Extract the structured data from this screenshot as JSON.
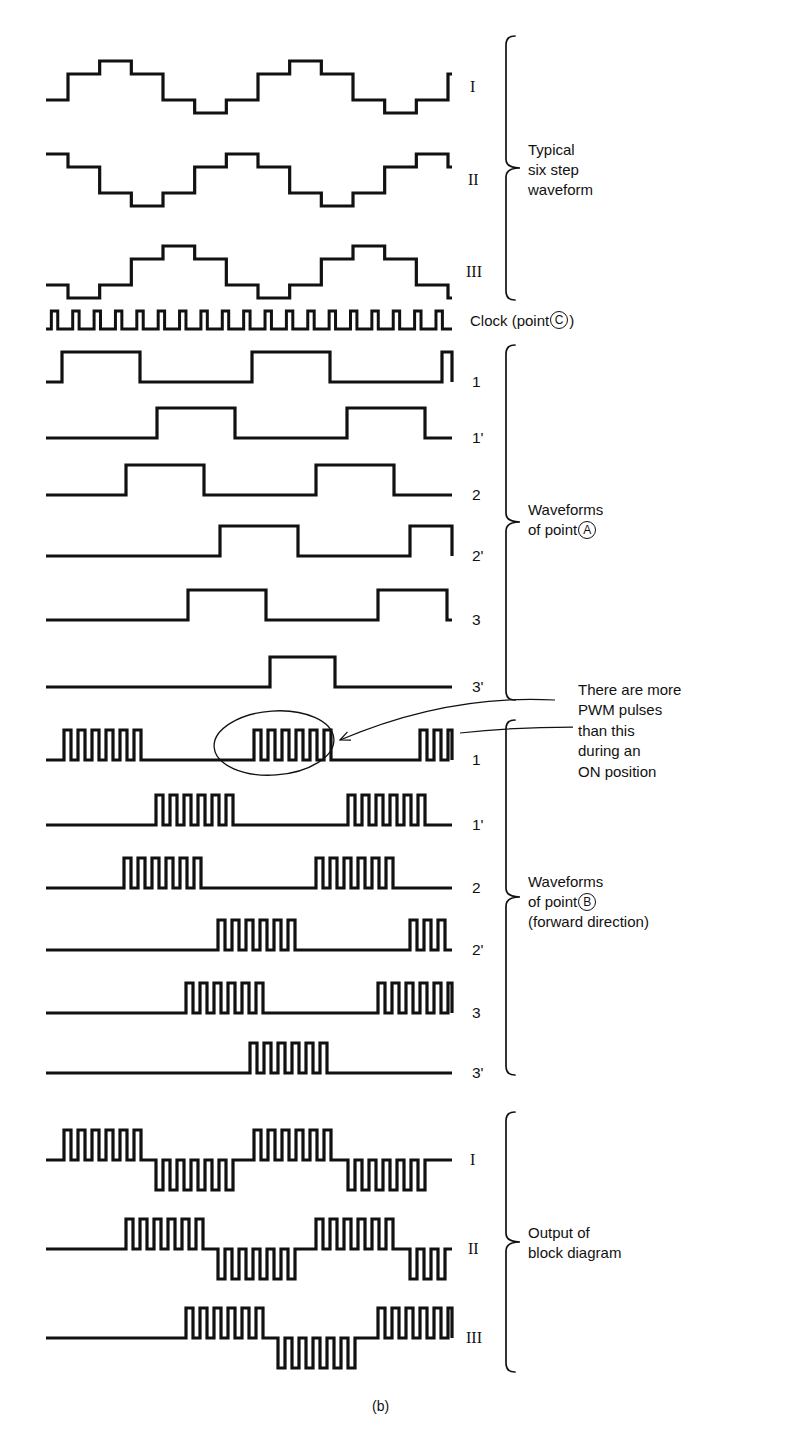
{
  "figure": {
    "caption": "(b)",
    "background": "#ffffff",
    "ink": "#111111"
  },
  "groups": [
    {
      "id": "six-step",
      "label_lines": "Typical\nsix step\nwaveform",
      "brace": {
        "x": 506,
        "top": 36,
        "bottom": 300,
        "tipx": 520,
        "midy": 168
      },
      "label_pos": {
        "x": 528,
        "y": 140
      }
    },
    {
      "id": "point-a",
      "label_line1": "Waveforms",
      "label_line2_pre": "of point",
      "label_circle": "A",
      "brace": {
        "x": 506,
        "top": 345,
        "bottom": 700,
        "tipx": 520,
        "midy": 522
      },
      "label_pos": {
        "x": 528,
        "y": 500
      }
    },
    {
      "id": "point-b",
      "label_line1": "Waveforms",
      "label_line2_pre": "of point",
      "label_circle": "B",
      "label_line3": "(forward direction)",
      "brace": {
        "x": 506,
        "top": 720,
        "bottom": 1075,
        "tipx": 520,
        "midy": 897
      },
      "label_pos": {
        "x": 528,
        "y": 872
      }
    },
    {
      "id": "output",
      "label_lines": "Output of\nblock diagram",
      "brace": {
        "x": 506,
        "top": 1112,
        "bottom": 1372,
        "tipx": 520,
        "midy": 1242
      },
      "label_pos": {
        "x": 528,
        "y": 1223
      }
    }
  ],
  "clock": {
    "label_prefix": "Clock (point",
    "label_circle": "C",
    "label_suffix": ")",
    "label_pos": {
      "x": 470,
      "y": 311
    },
    "pulses": 19,
    "baseline_y": 329,
    "amplitude": 18,
    "x_start": 46,
    "x_end": 452,
    "duty": 0.5
  },
  "annotation": {
    "text": "There are more\nPWM pulses\nthan this\nduring an\nON position",
    "pos": {
      "x": 578,
      "y": 680
    },
    "ellipse": {
      "cx": 274,
      "cy": 743,
      "rx": 60,
      "ry": 32,
      "rotate": -4
    },
    "arrow": {
      "from_x": 555,
      "from_y": 700,
      "to_x": 340,
      "to_y": 740
    },
    "leader": {
      "x1": 460,
      "y1": 727,
      "x2": 573,
      "y2": 727
    }
  },
  "rows": [
    {
      "name": "six-step-I",
      "label": "I",
      "label_style": "roman",
      "label_x": 470,
      "baseline_y": 87,
      "type": "sixstep",
      "phase": 0,
      "step_h": 26,
      "x_start": 46,
      "x_end": 452,
      "period": 190,
      "start_offset": 22
    },
    {
      "name": "six-step-II",
      "label": "II",
      "label_style": "roman",
      "label_x": 468,
      "baseline_y": 180,
      "type": "sixstep",
      "phase": 2,
      "step_h": 26,
      "x_start": 46,
      "x_end": 452,
      "period": 190,
      "start_offset": 22
    },
    {
      "name": "six-step-III",
      "label": "III",
      "label_style": "roman",
      "label_x": 466,
      "baseline_y": 272,
      "type": "sixstep",
      "phase": 4,
      "step_h": 26,
      "x_start": 46,
      "x_end": 452,
      "period": 190,
      "start_offset": 22
    },
    {
      "name": "point-a-1",
      "label": "1",
      "label_style": "num",
      "label_x": 472,
      "baseline_y": 382,
      "type": "square",
      "pulse_h": 30,
      "x_start": 46,
      "x_end": 452,
      "pulses": [
        [
          62,
          140
        ],
        [
          252,
          330
        ],
        [
          442,
          452
        ]
      ]
    },
    {
      "name": "point-a-1p",
      "label": "1'",
      "label_style": "num",
      "label_x": 472,
      "baseline_y": 438,
      "type": "square",
      "pulse_h": 30,
      "x_start": 46,
      "x_end": 452,
      "pulses": [
        [
          157,
          235
        ],
        [
          347,
          425
        ]
      ]
    },
    {
      "name": "point-a-2",
      "label": "2",
      "label_style": "num",
      "label_x": 472,
      "baseline_y": 495,
      "type": "square",
      "pulse_h": 30,
      "x_start": 46,
      "x_end": 452,
      "pulses": [
        [
          126,
          204
        ],
        [
          316,
          394
        ]
      ]
    },
    {
      "name": "point-a-2p",
      "label": "2'",
      "label_style": "num",
      "label_x": 472,
      "baseline_y": 556,
      "type": "square",
      "pulse_h": 30,
      "x_start": 46,
      "x_end": 452,
      "pulses": [
        [
          220,
          298
        ],
        [
          410,
          452
        ]
      ]
    },
    {
      "name": "point-a-3",
      "label": "3",
      "label_style": "num",
      "label_x": 472,
      "baseline_y": 620,
      "type": "square",
      "pulse_h": 30,
      "x_start": 46,
      "x_end": 452,
      "pulses": [
        [
          188,
          266
        ],
        [
          378,
          447
        ]
      ]
    },
    {
      "name": "point-a-3p",
      "label": "3'",
      "label_style": "num",
      "label_x": 472,
      "baseline_y": 687,
      "type": "square",
      "pulse_h": 30,
      "x_start": 46,
      "x_end": 452,
      "pulses": [
        [
          270,
          335
        ]
      ]
    },
    {
      "name": "point-b-1",
      "label": "1",
      "label_style": "num",
      "label_x": 472,
      "baseline_y": 760,
      "type": "burst",
      "pulse_h": 30,
      "x_start": 46,
      "x_end": 452,
      "pulse_w": 7,
      "gap_w": 7,
      "bursts": [
        {
          "x": 64,
          "count": 6
        },
        {
          "x": 254,
          "count": 6
        },
        {
          "x": 420,
          "count": 3
        }
      ]
    },
    {
      "name": "point-b-1p",
      "label": "1'",
      "label_style": "num",
      "label_x": 472,
      "baseline_y": 825,
      "type": "burst",
      "pulse_h": 30,
      "x_start": 46,
      "x_end": 452,
      "pulse_w": 7,
      "gap_w": 7,
      "bursts": [
        {
          "x": 156,
          "count": 6
        },
        {
          "x": 348,
          "count": 6
        }
      ]
    },
    {
      "name": "point-b-2",
      "label": "2",
      "label_style": "num",
      "label_x": 472,
      "baseline_y": 888,
      "type": "burst",
      "pulse_h": 30,
      "x_start": 46,
      "x_end": 452,
      "pulse_w": 7,
      "gap_w": 7,
      "bursts": [
        {
          "x": 124,
          "count": 6
        },
        {
          "x": 316,
          "count": 6
        }
      ]
    },
    {
      "name": "point-b-2p",
      "label": "2'",
      "label_style": "num",
      "label_x": 472,
      "baseline_y": 950,
      "type": "burst",
      "pulse_h": 30,
      "x_start": 46,
      "x_end": 452,
      "pulse_w": 7,
      "gap_w": 7,
      "bursts": [
        {
          "x": 218,
          "count": 6
        },
        {
          "x": 410,
          "count": 5
        }
      ]
    },
    {
      "name": "point-b-3",
      "label": "3",
      "label_style": "num",
      "label_x": 472,
      "baseline_y": 1013,
      "type": "burst",
      "pulse_h": 30,
      "x_start": 46,
      "x_end": 452,
      "pulse_w": 7,
      "gap_w": 7,
      "bursts": [
        {
          "x": 186,
          "count": 6
        },
        {
          "x": 378,
          "count": 6
        }
      ]
    },
    {
      "name": "point-b-3p",
      "label": "3'",
      "label_style": "num",
      "label_x": 472,
      "baseline_y": 1073,
      "type": "burst",
      "pulse_h": 30,
      "x_start": 46,
      "x_end": 452,
      "pulse_w": 7,
      "gap_w": 7,
      "bursts": [
        {
          "x": 250,
          "count": 6
        }
      ]
    },
    {
      "name": "output-I",
      "label": "I",
      "label_style": "roman",
      "label_x": 470,
      "baseline_y": 1160,
      "type": "bipolar",
      "pulse_h": 30,
      "x_start": 46,
      "x_end": 452,
      "pulse_w": 7,
      "gap_w": 7,
      "bursts": [
        {
          "x": 64,
          "count": 6,
          "dir": "up"
        },
        {
          "x": 156,
          "count": 6,
          "dir": "down"
        },
        {
          "x": 254,
          "count": 6,
          "dir": "up"
        },
        {
          "x": 348,
          "count": 6,
          "dir": "down"
        }
      ]
    },
    {
      "name": "output-II",
      "label": "II",
      "label_style": "roman",
      "label_x": 468,
      "baseline_y": 1249,
      "type": "bipolar",
      "pulse_h": 30,
      "x_start": 46,
      "x_end": 452,
      "pulse_w": 7,
      "gap_w": 7,
      "bursts": [
        {
          "x": 126,
          "count": 6,
          "dir": "up"
        },
        {
          "x": 218,
          "count": 6,
          "dir": "down"
        },
        {
          "x": 316,
          "count": 6,
          "dir": "up"
        },
        {
          "x": 410,
          "count": 5,
          "dir": "down"
        }
      ]
    },
    {
      "name": "output-III",
      "label": "III",
      "label_style": "roman",
      "label_x": 466,
      "baseline_y": 1338,
      "type": "bipolar",
      "pulse_h": 30,
      "x_start": 46,
      "x_end": 452,
      "pulse_w": 7,
      "gap_w": 7,
      "bursts": [
        {
          "x": 186,
          "count": 6,
          "dir": "up"
        },
        {
          "x": 278,
          "count": 6,
          "dir": "down"
        },
        {
          "x": 378,
          "count": 6,
          "dir": "up"
        }
      ]
    }
  ]
}
